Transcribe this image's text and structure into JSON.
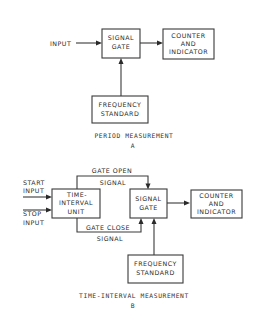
{
  "diagrams": [
    {
      "id": "A",
      "caption": "PERIOD MEASUREMENT",
      "letter": "A",
      "input_label": "INPUT",
      "blocks": {
        "signal_gate": [
          "SIGNAL",
          "GATE"
        ],
        "counter": [
          "COUNTER",
          "AND",
          "INDICATOR"
        ],
        "frequency_standard": [
          "FREQUENCY",
          "STANDARD"
        ]
      }
    },
    {
      "id": "B",
      "caption": "TIME-INTERVAL MEASUREMENT",
      "letter": "B",
      "start_input": [
        "START",
        "INPUT"
      ],
      "stop_input": [
        "STOP",
        "INPUT"
      ],
      "gate_open": [
        "GATE OPEN",
        "SIGNAL"
      ],
      "gate_close": [
        "GATE CLOSE",
        "SIGNAL"
      ],
      "blocks": {
        "time_interval_unit": [
          "TIME-",
          "INTERVAL",
          "UNIT"
        ],
        "signal_gate": [
          "SIGNAL",
          "GATE"
        ],
        "counter": [
          "COUNTER",
          "AND",
          "INDICATOR"
        ],
        "frequency_standard": [
          "FREQUENCY",
          "STANDARD"
        ]
      }
    }
  ]
}
